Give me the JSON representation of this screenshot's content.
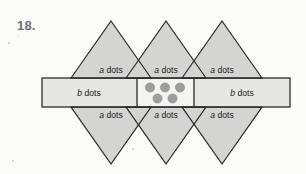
{
  "page": {
    "background_color": "#fbfbfa",
    "problem_number": "18."
  },
  "figure": {
    "name": "triangle-strip-dot-diagram",
    "colors": {
      "triangle_fill": "#d4d4d2",
      "bar_fill": "#e6e6e3",
      "center_cell_fill": "#f2f2ef",
      "stroke": "#2b2b2b",
      "dot_fill": "#9d9d9d",
      "dot_stroke": "#8a8a8a",
      "text": "#1a1a1a"
    },
    "bar": {
      "left_cell_label": "b dots",
      "right_cell_label": "b dots",
      "center_cell_label": ""
    },
    "top_triangles": [
      {
        "label": "a dots"
      },
      {
        "label": "a dots"
      },
      {
        "label": "a dots"
      }
    ],
    "bottom_triangles": [
      {
        "label": "a dots"
      },
      {
        "label": "a dots"
      },
      {
        "label": "a dots"
      }
    ],
    "dots": {
      "count": 5,
      "top_row_count": 3,
      "bottom_row_count": 2,
      "radius": 4.6
    },
    "labels": {
      "a_variable": "a",
      "b_variable": "b",
      "unit_word": "dots"
    }
  }
}
